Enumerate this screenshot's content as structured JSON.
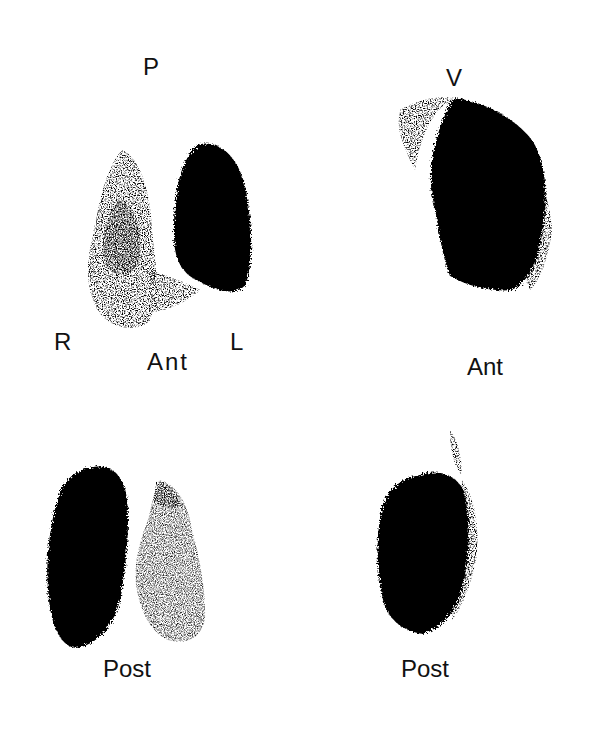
{
  "figure": {
    "panels": [
      {
        "id": "top-left",
        "view": "Ant",
        "labels": {
          "top": "P",
          "left": "R",
          "right": "L",
          "bottom": "Ant"
        }
      },
      {
        "id": "top-right",
        "view": "Ant",
        "labels": {
          "top": "V",
          "bottom": "Ant"
        }
      },
      {
        "id": "bottom-left",
        "view": "Post",
        "labels": {
          "bottom": "Post"
        }
      },
      {
        "id": "bottom-right",
        "view": "Post",
        "labels": {
          "bottom": "Post"
        }
      }
    ],
    "colors": {
      "ink": "#000000",
      "background": "#ffffff"
    }
  }
}
